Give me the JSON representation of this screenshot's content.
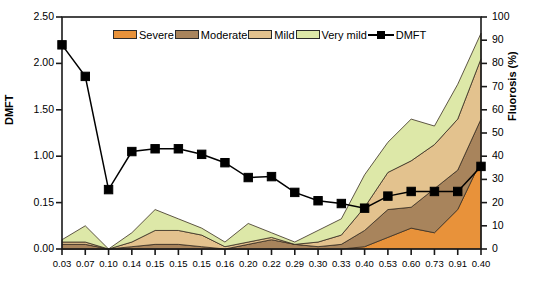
{
  "chart_data": {
    "type": "area",
    "title": "",
    "xlabel": "",
    "ylabel": "DMFT",
    "y2label": "Fluorosis (%)",
    "grid": false,
    "legend_position": "top-center",
    "categories": [
      "0.03",
      "0.07",
      "0.10",
      "0.14",
      "0.15",
      "0.15",
      "0.15",
      "0.16",
      "0.20",
      "0.22",
      "0.29",
      "0.30",
      "0.33",
      "0.40",
      "0.53",
      "0.60",
      "0.73",
      "0.91",
      "0.40"
    ],
    "ylim": [
      0,
      2.5
    ],
    "ytick_labels": [
      "2.50",
      "2.00",
      "1.50",
      "1.00",
      "0.15",
      "0.00"
    ],
    "ytick_values": [
      2.5,
      2.0,
      1.5,
      1.0,
      0.5,
      0.0
    ],
    "y2lim": [
      0,
      100
    ],
    "y2tick_labels": [
      "100",
      "90",
      "80",
      "70",
      "60",
      "50",
      "40",
      "30",
      "20",
      "10",
      "0"
    ],
    "y2tick_values": [
      100,
      90,
      80,
      70,
      60,
      50,
      40,
      30,
      20,
      10,
      0
    ],
    "stacked": true,
    "stack_order_bottom_to_top": [
      "Severe",
      "Moderate",
      "Mild",
      "Very mild"
    ],
    "series": [
      {
        "name": "Severe",
        "color": "#E8923A",
        "axis": "y2",
        "values": [
          0,
          0,
          0,
          0,
          0,
          0,
          0,
          0,
          0,
          0,
          0,
          0,
          0,
          1,
          5,
          9,
          7,
          17,
          38
        ]
      },
      {
        "name": "Moderate",
        "color": "#A8845C",
        "axis": "y2",
        "values": [
          2,
          2,
          0,
          1,
          2,
          2,
          1,
          0,
          2,
          4,
          2,
          1,
          2,
          7,
          12,
          9,
          19,
          17,
          18
        ]
      },
      {
        "name": "Mild",
        "color": "#E3C28E",
        "axis": "y2",
        "values": [
          1,
          1,
          0,
          2,
          6,
          6,
          5,
          1,
          1,
          1,
          0,
          2,
          4,
          10,
          16,
          20,
          19,
          22,
          26
        ]
      },
      {
        "name": "Very mild",
        "color": "#DDE8A8",
        "axis": "y2",
        "values": [
          1,
          7,
          0,
          4,
          9,
          5,
          3,
          2,
          8,
          2,
          1,
          5,
          7,
          14,
          13,
          18,
          8,
          15,
          11
        ]
      }
    ],
    "line_series": {
      "name": "DMFT",
      "color": "#000000",
      "axis": "y",
      "marker": "square",
      "values": [
        2.2,
        1.86,
        0.64,
        1.05,
        1.08,
        1.08,
        1.02,
        0.93,
        0.77,
        0.78,
        0.61,
        0.52,
        0.49,
        0.44,
        0.57,
        0.62,
        0.62,
        0.62,
        0.89
      ]
    },
    "legend_entries": [
      {
        "label": "Severe",
        "color": "#E8923A",
        "kind": "swatch"
      },
      {
        "label": "Moderate",
        "color": "#A8845C",
        "kind": "swatch"
      },
      {
        "label": "Mild",
        "color": "#E3C28E",
        "kind": "swatch"
      },
      {
        "label": "Very mild",
        "color": "#DDE8A8",
        "kind": "swatch"
      },
      {
        "label": "DMFT",
        "color": "#000000",
        "kind": "line-marker"
      }
    ]
  }
}
